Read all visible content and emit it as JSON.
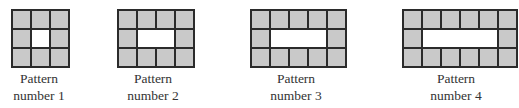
{
  "figure": {
    "fill_color": "#c9c9c9",
    "border_color": "#2b2b2b",
    "hole_color": "#ffffff",
    "patterns": [
      {
        "label_line1": "Pattern",
        "label_line2": "number 1",
        "cols": 3,
        "rows": 3,
        "left": 11,
        "label_center": 39
      },
      {
        "label_line1": "Pattern",
        "label_line2": "number 2",
        "cols": 4,
        "rows": 3,
        "left": 117,
        "label_center": 153
      },
      {
        "label_line1": "Pattern",
        "label_line2": "number 3",
        "cols": 5,
        "rows": 3,
        "left": 250,
        "label_center": 296
      },
      {
        "label_line1": "Pattern",
        "label_line2": "number 4",
        "cols": 6,
        "rows": 3,
        "left": 402,
        "label_center": 456
      }
    ]
  }
}
